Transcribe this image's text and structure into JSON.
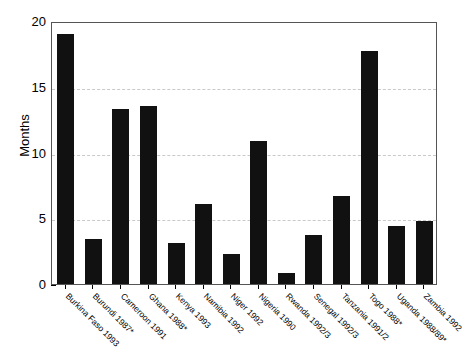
{
  "chart_data": {
    "type": "bar",
    "title": "",
    "subtitle": "",
    "xlabel": "",
    "ylabel": "Months",
    "ylim": [
      0,
      20
    ],
    "yticks": [
      0,
      5,
      10,
      15,
      20
    ],
    "ytick_labels": [
      "0",
      "5",
      "10",
      "15",
      "20"
    ],
    "grid": true,
    "grid_axis": "y",
    "grid_style": "dashed",
    "legend": false,
    "bar_color": "#111111",
    "categories": [
      "Burkina Faso 1993",
      "Burundi 1987*",
      "Cameroon 1991",
      "Ghana 1988*",
      "Kenya 1993",
      "Namibia 1992",
      "Niger 1992",
      "Nigeria 1990",
      "Rwanda 1992/3",
      "Senegal 1992/3",
      "Tanzania 1991/2",
      "Togo 1988*",
      "Uganda 1988/89*",
      "Zambia 1992"
    ],
    "values": [
      19.0,
      3.4,
      13.3,
      13.5,
      3.1,
      6.1,
      2.3,
      10.9,
      0.8,
      3.7,
      6.7,
      17.7,
      4.4,
      4.8
    ]
  }
}
